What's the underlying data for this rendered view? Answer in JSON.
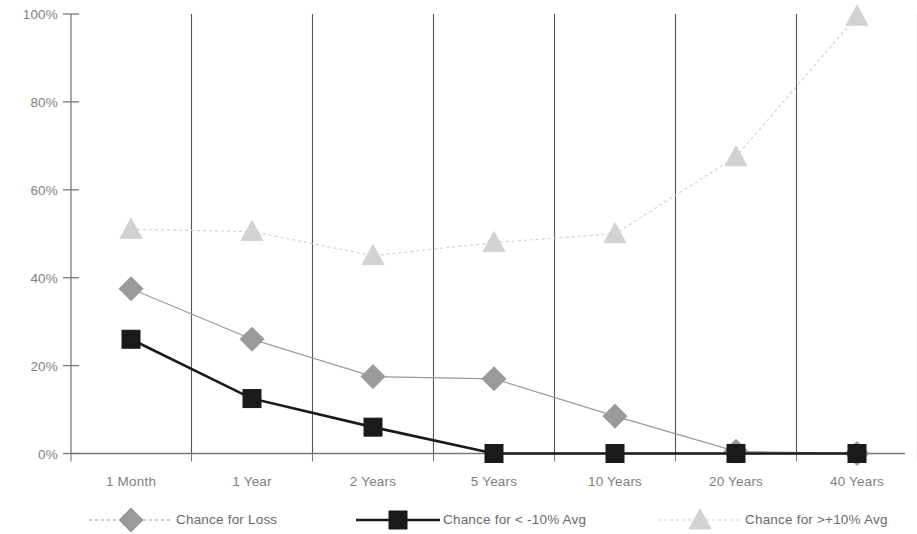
{
  "chart_data": {
    "type": "line",
    "title": "",
    "subtitle": "",
    "xlabel": "",
    "ylabel": "",
    "categories": [
      "1 Month",
      "1 Year",
      "2 Years",
      "5 Years",
      "10 Years",
      "20 Years",
      "40 Years"
    ],
    "ylim": [
      0,
      100
    ],
    "yticks": [
      0,
      20,
      40,
      60,
      80,
      100
    ],
    "ytick_labels": [
      "0%",
      "20%",
      "40%",
      "60%",
      "80%",
      "100%"
    ],
    "grid": "vertical",
    "legend_position": "bottom",
    "series": [
      {
        "name": "Chance for Loss",
        "marker": "diamond",
        "line_style": "solid-thin",
        "color": "#9a9a9a",
        "values": [
          37.5,
          26,
          17.5,
          17,
          8.5,
          0.5,
          0
        ]
      },
      {
        "name": "Chance for < -10% Avg",
        "marker": "square",
        "line_style": "solid-thick",
        "color": "#1a1a1a",
        "values": [
          26,
          12.5,
          6,
          0,
          0,
          0,
          0
        ]
      },
      {
        "name": "Chance for >+10% Avg",
        "marker": "triangle",
        "line_style": "dotted",
        "color": "#d2d2d2",
        "values": [
          51,
          50.5,
          45,
          48,
          50,
          67.5,
          99.5
        ]
      }
    ]
  },
  "axis": {
    "y_tick_labels": [
      "100%",
      "80%",
      "60%",
      "40%",
      "20%",
      "0%"
    ],
    "x_tick_labels": [
      "1 Month",
      "1 Year",
      "2 Years",
      "5 Years",
      "10 Years",
      "20 Years",
      "40 Years"
    ]
  },
  "legend": {
    "items": [
      {
        "label": "Chance for Loss",
        "marker": "diamond-icon",
        "color": "#9a9a9a"
      },
      {
        "label": "Chance for < -10% Avg",
        "marker": "square-icon",
        "color": "#1a1a1a"
      },
      {
        "label": "Chance for >+10% Avg",
        "marker": "triangle-icon",
        "color": "#d2d2d2"
      }
    ]
  },
  "colors": {
    "axis": "#7a7a7a",
    "gridline": "#555555",
    "text": "#808080",
    "loss_series": "#9a9a9a",
    "neg10_series": "#1a1a1a",
    "pos10_series": "#d2d2d2",
    "background": "#ffffff"
  }
}
